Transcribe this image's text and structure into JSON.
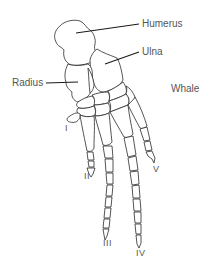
{
  "diagram": {
    "title": "Whale",
    "bone_labels": {
      "humerus": "Humerus",
      "ulna": "Ulna",
      "radius": "Radius"
    },
    "digits": [
      {
        "numeral": "I"
      },
      {
        "numeral": "II"
      },
      {
        "numeral": "III"
      },
      {
        "numeral": "IV"
      },
      {
        "numeral": "V"
      }
    ],
    "colors": {
      "label_text": "#555555",
      "bone_outline": "#2a2a2a",
      "leader_line": "#1a1a1a",
      "background": "#ffffff"
    }
  }
}
